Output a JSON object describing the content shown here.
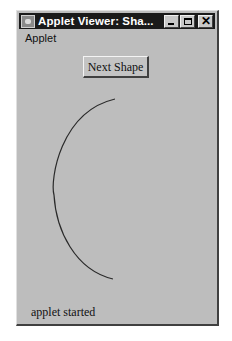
{
  "window": {
    "title": "Applet Viewer: Sha...",
    "controls": {
      "minimize": "minimize",
      "maximize": "maximize",
      "close": "✕"
    }
  },
  "menu": {
    "items": [
      {
        "label": "Applet"
      }
    ]
  },
  "applet": {
    "button_label": "Next Shape",
    "shape": {
      "type": "arc",
      "color": "#2a2a2a",
      "start": [
        115,
        99
      ],
      "leftmost": [
        54,
        190
      ],
      "end": [
        113,
        279
      ]
    }
  },
  "status": {
    "text": "applet started"
  },
  "colors": {
    "background": "#bdbdbd",
    "titlebar": "#1a1a1a"
  }
}
